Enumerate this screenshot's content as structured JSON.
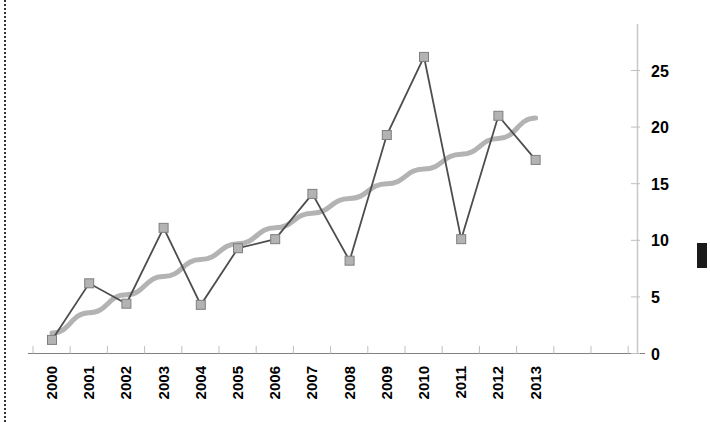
{
  "chart_data": {
    "type": "line",
    "title": "",
    "subtitle": "",
    "xlabel": "",
    "ylabel": "",
    "categories": [
      "2000",
      "2001",
      "2002",
      "2003",
      "2004",
      "2005",
      "2006",
      "2007",
      "2008",
      "2009",
      "2010",
      "2011",
      "2012",
      "2013"
    ],
    "series": [
      {
        "name": "data",
        "type": "line",
        "marker": "square",
        "color": "#4d4d4d",
        "marker_color": "#b3b3b3",
        "marker_edge_color": "#7f7f7f",
        "values": [
          1.2,
          6.2,
          4.4,
          11.1,
          4.3,
          9.3,
          10.1,
          14.1,
          8.2,
          19.3,
          26.2,
          10.1,
          21.0,
          17.1
        ]
      },
      {
        "name": "trendline",
        "type": "trend",
        "marker": "none",
        "color": "#b3b3b3",
        "values": [
          1.8,
          3.6,
          5.2,
          6.8,
          8.3,
          9.7,
          11.1,
          12.4,
          13.7,
          15.0,
          16.3,
          17.6,
          19.0,
          20.8
        ]
      }
    ],
    "yticks": [
      0,
      5,
      10,
      15,
      20,
      25
    ],
    "ytick_labels": [
      "0",
      "5",
      "10",
      "15",
      "20",
      "25"
    ],
    "ylim": [
      0,
      28
    ],
    "y_axis_position": "right",
    "xtick_rotation": -90,
    "grid": false,
    "legend": false
  },
  "axes": {
    "x_axis_color": "#808080",
    "y_axis_color": "#bfbfbf",
    "tick_color": "#bfbfbf"
  },
  "decor": {
    "left_rule_name": "dotted vertical rule",
    "right_marker_name": "dark edge marker"
  }
}
